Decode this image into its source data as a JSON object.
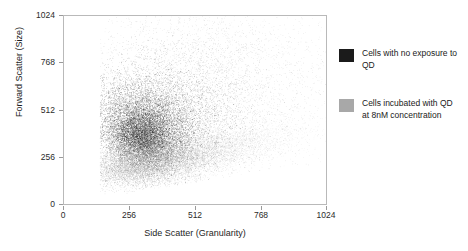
{
  "chart_data": {
    "type": "scatter",
    "title": "",
    "xlabel": "Side Scatter (Granularity)",
    "ylabel": "Forward Scatter (Size)",
    "xlim": [
      0,
      1024
    ],
    "ylim": [
      0,
      1024
    ],
    "xticks": [
      0,
      256,
      512,
      768,
      1024
    ],
    "yticks": [
      0,
      256,
      512,
      768,
      1024
    ],
    "xtick_labels": [
      "0",
      "256",
      "512",
      "768",
      "1024"
    ],
    "ytick_labels": [
      "0",
      "256",
      "512",
      "768",
      "1024"
    ],
    "grid": false,
    "legend_position": "right-outside",
    "series": [
      {
        "name": "Cells with no exposure to QD",
        "color": "#1b1b1b",
        "point_count": 17000,
        "description": "Dense dark cloud centred near Side Scatter 330, Forward Scatter 430, elongated diagonally toward upper-right with a long sparse tail spreading up to Forward Scatter 1024 and right to Side Scatter 1024.",
        "clusters": [
          {
            "cx": 320,
            "cy": 430,
            "sx": 95,
            "sy": 120,
            "rot": 28,
            "n": 6200,
            "alpha": 0.62,
            "size": 1.0
          },
          {
            "cx": 300,
            "cy": 360,
            "sx": 60,
            "sy": 70,
            "rot": 25,
            "n": 3600,
            "alpha": 0.72,
            "size": 1.0
          },
          {
            "cx": 430,
            "cy": 520,
            "sx": 150,
            "sy": 165,
            "rot": 20,
            "n": 3400,
            "alpha": 0.4,
            "size": 1.0
          },
          {
            "cx": 560,
            "cy": 650,
            "sx": 240,
            "sy": 230,
            "rot": 15,
            "n": 2400,
            "alpha": 0.24,
            "size": 1.0
          },
          {
            "cx": 620,
            "cy": 760,
            "sx": 300,
            "sy": 250,
            "rot": 0,
            "n": 1400,
            "alpha": 0.16,
            "size": 1.0
          }
        ]
      },
      {
        "name": "Cells incubated with QD at 8nM concentration",
        "color": "#8d8d8d",
        "point_count": 11000,
        "description": "Grey wedge-shaped population hugging the lower boundary, running from Side Scatter 150 / Forward Scatter 80 upward and rightward to Side Scatter 820 / Forward Scatter 330; the lower edge rises linearly to the right.",
        "clusters": [
          {
            "cx": 300,
            "cy": 220,
            "sx": 110,
            "sy": 58,
            "rot": 12,
            "n": 4600,
            "alpha": 0.55,
            "size": 1.0
          },
          {
            "cx": 400,
            "cy": 250,
            "sx": 150,
            "sy": 62,
            "rot": 13,
            "n": 3200,
            "alpha": 0.42,
            "size": 1.0
          },
          {
            "cx": 540,
            "cy": 290,
            "sx": 165,
            "sy": 60,
            "rot": 14,
            "n": 2000,
            "alpha": 0.28,
            "size": 1.0
          },
          {
            "cx": 680,
            "cy": 330,
            "sx": 160,
            "sy": 55,
            "rot": 14,
            "n": 1200,
            "alpha": 0.18,
            "size": 1.0
          }
        ]
      }
    ]
  },
  "axes": {
    "y_title": "Forward Scatter (Size)",
    "x_title": "Side Scatter (Granularity)",
    "y_ticks": [
      "1024",
      "768",
      "512",
      "256",
      "0"
    ],
    "x_ticks": [
      "0",
      "256",
      "512",
      "768",
      "1024"
    ]
  },
  "legend": {
    "entries": [
      {
        "label": "Cells with no exposure to QD",
        "color": "#1b1b1b",
        "swatch_name": "legend-swatch-black"
      },
      {
        "label": "Cells incubated with QD at 8nM concentration",
        "color": "#a8a8a8",
        "swatch_name": "legend-swatch-gray"
      }
    ]
  }
}
